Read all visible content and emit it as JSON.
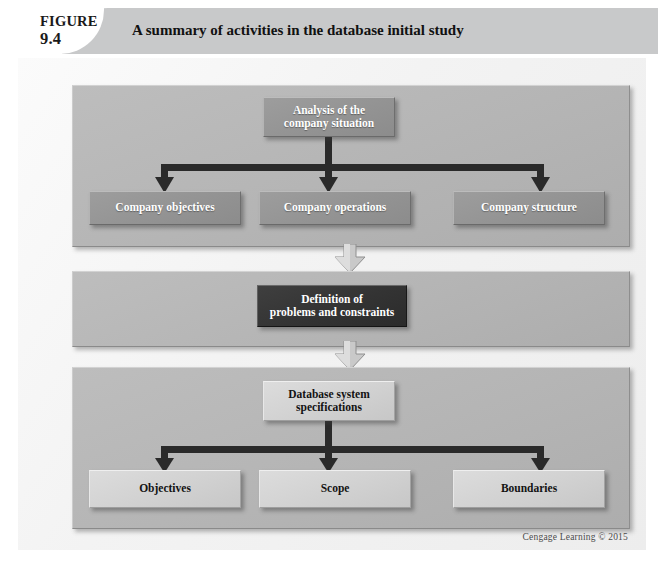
{
  "figure": {
    "label_word": "FIGURE",
    "number": "9.4",
    "caption": "A summary of activities in the database initial study",
    "credit": "Cengage Learning © 2015"
  },
  "colors": {
    "page_background": "#ffffff",
    "header_bar": "#c8c9ca",
    "plate": "#f2f2f2",
    "panel": "#b6b6b6",
    "node_mid": "#949494",
    "node_dark": "#343434",
    "node_light": "#d2d2d2",
    "connector": "#2a2a2a",
    "text_on_dark": "#ffffff",
    "text_on_light": "#131313"
  },
  "panels": [
    {
      "id": "panel-1",
      "name": "company-analysis-panel",
      "root": {
        "id": "node-analysis",
        "style": "mid",
        "lines": [
          "Analysis of the",
          "company situation"
        ]
      },
      "children": [
        {
          "id": "node-objectives",
          "style": "mid",
          "lines": [
            "Company objectives"
          ]
        },
        {
          "id": "node-operations",
          "style": "mid",
          "lines": [
            "Company operations"
          ]
        },
        {
          "id": "node-structure",
          "style": "mid",
          "lines": [
            "Company structure"
          ]
        }
      ]
    },
    {
      "id": "panel-2",
      "name": "problem-definition-panel",
      "root": {
        "id": "node-definition",
        "style": "dark",
        "lines": [
          "Definition of",
          "problems and constraints"
        ]
      },
      "children": []
    },
    {
      "id": "panel-3",
      "name": "database-specifications-panel",
      "root": {
        "id": "node-specs",
        "style": "light",
        "lines": [
          "Database system",
          "specifications"
        ]
      },
      "children": [
        {
          "id": "node-obj2",
          "style": "light",
          "lines": [
            "Objectives"
          ]
        },
        {
          "id": "node-scope",
          "style": "light",
          "lines": [
            "Scope"
          ]
        },
        {
          "id": "node-boundaries",
          "style": "light",
          "lines": [
            "Boundaries"
          ]
        }
      ]
    }
  ],
  "flow_arrows": [
    {
      "id": "arrow-1",
      "name": "flow-arrow-down-1",
      "from": "panel-1",
      "to": "panel-2",
      "direction": "down"
    },
    {
      "id": "arrow-2",
      "name": "flow-arrow-down-2",
      "from": "panel-2",
      "to": "panel-3",
      "direction": "down"
    }
  ],
  "nodes": {
    "analysis": {
      "l1": "Analysis of the",
      "l2": "company situation"
    },
    "objectives": {
      "l1": "Company objectives"
    },
    "operations": {
      "l1": "Company operations"
    },
    "structure": {
      "l1": "Company structure"
    },
    "definition": {
      "l1": "Definition of",
      "l2": "problems and constraints"
    },
    "specs": {
      "l1": "Database system",
      "l2": "specifications"
    },
    "obj2": {
      "l1": "Objectives"
    },
    "scope": {
      "l1": "Scope"
    },
    "boundaries": {
      "l1": "Boundaries"
    }
  }
}
